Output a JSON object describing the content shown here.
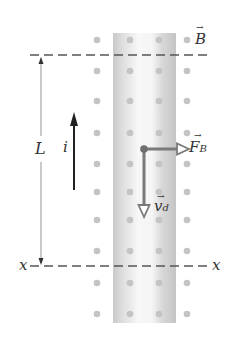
{
  "diagram": {
    "labels": {
      "field": "B",
      "length": "L",
      "current": "i",
      "force": "F",
      "force_sub": "B",
      "velocity": "v",
      "velocity_sub": "d",
      "axis_left": "x",
      "axis_right": "x",
      "vector_arrow": "→"
    },
    "colors": {
      "dot": "#c4c4c4",
      "dash": "#555555",
      "strip_edge": "#c8c8c8",
      "vector": "#7a7a7a",
      "text": "#333333"
    },
    "dot_columns_x": [
      97,
      130,
      159,
      187
    ],
    "dot_rows_y": [
      40,
      71,
      101,
      133,
      164,
      192,
      220,
      251,
      283,
      314
    ]
  }
}
